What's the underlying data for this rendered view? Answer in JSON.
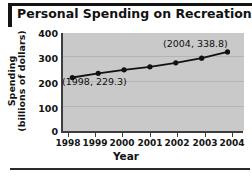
{
  "chart_data": {
    "type": "line",
    "title": "Personal Spending on Recreation",
    "xlabel": "Year",
    "ylabel_line1": "Spending",
    "ylabel_line2": "(billions of dollars)",
    "categories": [
      1998,
      1999,
      2000,
      2001,
      2002,
      2003,
      2004
    ],
    "xtick_labels": [
      "1998",
      "1999",
      "2000",
      "2001",
      "2002",
      "2003",
      "2004"
    ],
    "values": [
      229.3,
      247.0,
      262.0,
      275.0,
      292.0,
      312.0,
      338.8
    ],
    "ytick_labels": [
      "400",
      "300",
      "200",
      "100",
      "0"
    ],
    "ytick_values": [
      400,
      300,
      200,
      100,
      0
    ],
    "ylim": [
      0,
      420
    ],
    "xlim": [
      1997.6,
      2004.6
    ],
    "grid": true,
    "legend": "none",
    "marker": "filled-circle",
    "line_color": "#111111",
    "marker_color": "#111111",
    "plot_background": "#c9c9c9",
    "gridline_color": "#b4b4b4",
    "annotations": [
      {
        "label": "(1998, 229.3)",
        "x": 1998,
        "y": 229.3
      },
      {
        "label": "(2004, 338.8)",
        "x": 2004,
        "y": 338.8
      }
    ]
  }
}
